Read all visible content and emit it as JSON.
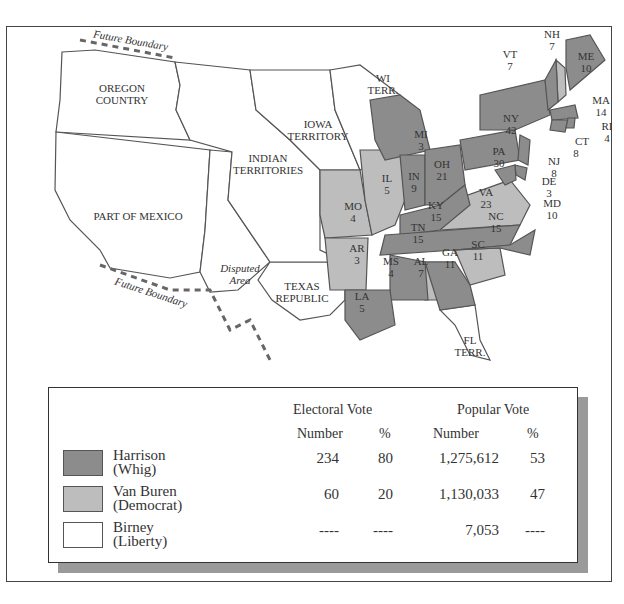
{
  "map": {
    "title": "Election of 1840",
    "colors": {
      "harrison": "#8c8c8c",
      "van_buren": "#bdbdbd",
      "birney": "#ffffff",
      "territory": "#ffffff",
      "border": "#555555"
    },
    "regions": [
      {
        "name": "OREGON",
        "line2": "COUNTRY"
      },
      {
        "name": "IOWA",
        "line2": "TERRITORY"
      },
      {
        "name": "INDIAN",
        "line2": "TERRITORIES"
      },
      {
        "name": "PART OF MEXICO"
      },
      {
        "name": "Disputed",
        "line2": "Area"
      },
      {
        "name": "TEXAS",
        "line2": "REPUBLIC"
      },
      {
        "name": "WI",
        "line2": "TERR."
      },
      {
        "name": "FL",
        "line2": "TERR."
      },
      {
        "name": "Future Boundary"
      },
      {
        "name": "Future Boundary"
      }
    ],
    "states": [
      {
        "abbr": "ME",
        "ev": "10",
        "winner": "harrison"
      },
      {
        "abbr": "NH",
        "ev": "7",
        "winner": "van_buren"
      },
      {
        "abbr": "VT",
        "ev": "7",
        "winner": "harrison"
      },
      {
        "abbr": "MA",
        "ev": "14",
        "winner": "harrison"
      },
      {
        "abbr": "RI",
        "ev": "4",
        "winner": "harrison"
      },
      {
        "abbr": "CT",
        "ev": "8",
        "winner": "harrison"
      },
      {
        "abbr": "NY",
        "ev": "42",
        "winner": "harrison"
      },
      {
        "abbr": "NJ",
        "ev": "8",
        "winner": "harrison"
      },
      {
        "abbr": "PA",
        "ev": "30",
        "winner": "harrison"
      },
      {
        "abbr": "DE",
        "ev": "3",
        "winner": "harrison"
      },
      {
        "abbr": "MD",
        "ev": "10",
        "winner": "harrison"
      },
      {
        "abbr": "VA",
        "ev": "23",
        "winner": "van_buren"
      },
      {
        "abbr": "NC",
        "ev": "15",
        "winner": "harrison"
      },
      {
        "abbr": "SC",
        "ev": "11",
        "winner": "van_buren"
      },
      {
        "abbr": "GA",
        "ev": "11",
        "winner": "harrison"
      },
      {
        "abbr": "AL",
        "ev": "7",
        "winner": "van_buren"
      },
      {
        "abbr": "MS",
        "ev": "4",
        "winner": "harrison"
      },
      {
        "abbr": "LA",
        "ev": "5",
        "winner": "harrison"
      },
      {
        "abbr": "TN",
        "ev": "15",
        "winner": "harrison"
      },
      {
        "abbr": "KY",
        "ev": "15",
        "winner": "harrison"
      },
      {
        "abbr": "OH",
        "ev": "21",
        "winner": "harrison"
      },
      {
        "abbr": "IN",
        "ev": "9",
        "winner": "harrison"
      },
      {
        "abbr": "IL",
        "ev": "5",
        "winner": "van_buren"
      },
      {
        "abbr": "MI",
        "ev": "3",
        "winner": "harrison"
      },
      {
        "abbr": "MO",
        "ev": "4",
        "winner": "van_buren"
      },
      {
        "abbr": "AR",
        "ev": "3",
        "winner": "van_buren"
      }
    ]
  },
  "legend": {
    "headers": {
      "electoral": "Electoral Vote",
      "popular": "Popular Vote",
      "number": "Number",
      "percent": "%"
    },
    "rows": [
      {
        "candidate": "Harrison",
        "party": "(Whig)",
        "ev_number": "234",
        "ev_percent": "80",
        "pop_number": "1,275,612",
        "pop_percent": "53",
        "color": "#8c8c8c"
      },
      {
        "candidate": "Van Buren",
        "party": "(Democrat)",
        "ev_number": "60",
        "ev_percent": "20",
        "pop_number": "1,130,033",
        "pop_percent": "47",
        "color": "#bdbdbd"
      },
      {
        "candidate": "Birney",
        "party": "(Liberty)",
        "ev_number": "----",
        "ev_percent": "----",
        "pop_number": "7,053",
        "pop_percent": "----",
        "color": "#ffffff"
      }
    ]
  }
}
